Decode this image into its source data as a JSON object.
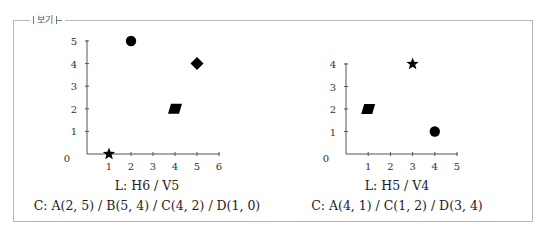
{
  "panel": {
    "legend_label": "보기"
  },
  "charts": [
    {
      "id": "left",
      "caption_line1": "L: H6 / V5",
      "caption_line2": "C: A(2, 5) / B(5, 4) / C(4, 2) / D(1, 0)"
    },
    {
      "id": "right",
      "caption_line1": "L: H5 / V4",
      "caption_line2": "C: A(4, 1) / C(1, 2) / D(3, 4)"
    }
  ],
  "chart_data": [
    {
      "type": "scatter",
      "title": "",
      "xlabel": "",
      "ylabel": "",
      "xlim": [
        0,
        6
      ],
      "ylim": [
        0,
        5
      ],
      "x_ticks": [
        1,
        2,
        3,
        4,
        5,
        6
      ],
      "y_ticks": [
        1,
        2,
        3,
        4,
        5
      ],
      "origin_label": "0",
      "grid": false,
      "points": [
        {
          "label": "A",
          "x": 2,
          "y": 5,
          "marker": "circle"
        },
        {
          "label": "B",
          "x": 5,
          "y": 4,
          "marker": "diamond"
        },
        {
          "label": "C",
          "x": 4,
          "y": 2,
          "marker": "parallelogram"
        },
        {
          "label": "D",
          "x": 1,
          "y": 0,
          "marker": "star"
        }
      ],
      "annotation": [
        "L: H6 / V5",
        "C: A(2, 5) / B(5, 4) / C(4, 2) / D(1, 0)"
      ]
    },
    {
      "type": "scatter",
      "title": "",
      "xlabel": "",
      "ylabel": "",
      "xlim": [
        0,
        5
      ],
      "ylim": [
        0,
        4
      ],
      "x_ticks": [
        1,
        2,
        3,
        4,
        5
      ],
      "y_ticks": [
        1,
        2,
        3,
        4
      ],
      "origin_label": "0",
      "grid": false,
      "points": [
        {
          "label": "A",
          "x": 4,
          "y": 1,
          "marker": "circle"
        },
        {
          "label": "C",
          "x": 1,
          "y": 2,
          "marker": "parallelogram"
        },
        {
          "label": "D",
          "x": 3,
          "y": 4,
          "marker": "star"
        }
      ],
      "annotation": [
        "L: H5 / V4",
        "C: A(4, 1) / C(1, 2) / D(3, 4)"
      ]
    }
  ]
}
